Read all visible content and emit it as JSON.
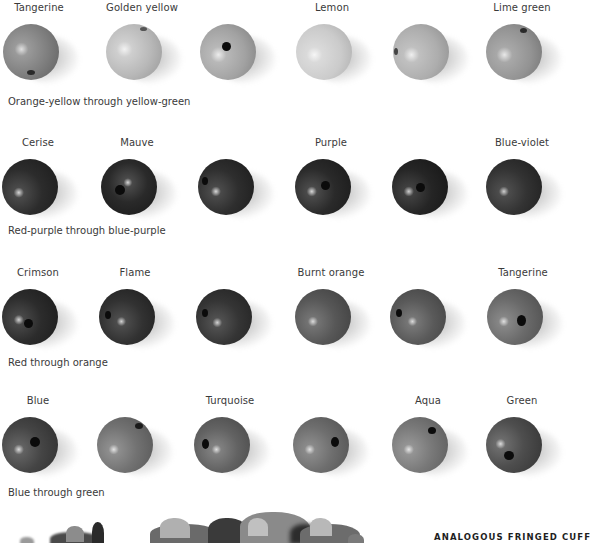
{
  "rows": [
    {
      "caption": "Orange-yellow through yellow-green",
      "beads": [
        {
          "label": "Tangerine",
          "tone": "#8a8a8a",
          "hole": "bottom"
        },
        {
          "label": "Golden yellow",
          "tone": "#bcbcbc",
          "hole": "top-edge"
        },
        {
          "label": "",
          "tone": "#a8a8a8",
          "hole": "center"
        },
        {
          "label": "Lemon",
          "tone": "#d2d2d2",
          "hole": "none"
        },
        {
          "label": "",
          "tone": "#b4b4b4",
          "hole": "left-edge"
        },
        {
          "label": "Lime green",
          "tone": "#9a9a9a",
          "hole": "top-edge"
        }
      ]
    },
    {
      "caption": "Red-purple through blue-purple",
      "beads": [
        {
          "label": "Cerise",
          "tone": "#2c2c2c",
          "hole": "none"
        },
        {
          "label": "Mauve",
          "tone": "#2a2a2a",
          "hole": "center-left"
        },
        {
          "label": "",
          "tone": "#2e2e2e",
          "hole": "left-edge"
        },
        {
          "label": "Purple",
          "tone": "#2a2a2a",
          "hole": "center"
        },
        {
          "label": "",
          "tone": "#262626",
          "hole": "center"
        },
        {
          "label": "Blue-violet",
          "tone": "#323232",
          "hole": "none"
        }
      ]
    },
    {
      "caption": "Red through orange",
      "beads": [
        {
          "label": "Crimson",
          "tone": "#2c2c2c",
          "hole": "center-low"
        },
        {
          "label": "Flame",
          "tone": "#323232",
          "hole": "left-edge"
        },
        {
          "label": "",
          "tone": "#353535",
          "hole": "left-edge"
        },
        {
          "label": "Burnt orange",
          "tone": "#575757",
          "hole": "none"
        },
        {
          "label": "",
          "tone": "#5a5a5a",
          "hole": "left-edge"
        },
        {
          "label": "Tangerine",
          "tone": "#6a6a6a",
          "hole": "center-right"
        }
      ]
    },
    {
      "caption": "Blue through green",
      "beads": [
        {
          "label": "Blue",
          "tone": "#454545",
          "hole": "center"
        },
        {
          "label": "",
          "tone": "#727272",
          "hole": "top-edge"
        },
        {
          "label": "Turquoise",
          "tone": "#636363",
          "hole": "left-edge"
        },
        {
          "label": "",
          "tone": "#6e6e6e",
          "hole": "center-right"
        },
        {
          "label": "Aqua",
          "tone": "#797979",
          "hole": "top-right"
        },
        {
          "label": "Green",
          "tone": "#4e4e4e",
          "hole": "center-low"
        }
      ]
    }
  ],
  "footer": {
    "title": "ANALOGOUS FRINGED CUFF"
  }
}
